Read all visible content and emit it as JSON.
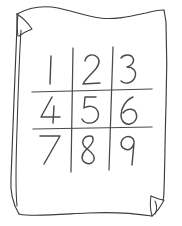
{
  "canvas": {
    "width": 182,
    "height": 226,
    "background_color": "#ffffff"
  },
  "figure": {
    "style": "hand-drawn line sketch",
    "ink_color": "#4a4a4a",
    "outline_color": "#3b3b3b",
    "paper_color": "#ffffff"
  },
  "paper": {
    "name": "sheet-of-paper",
    "description": "Wavy-edged rectangular sheet",
    "corner_folds": [
      {
        "name": "top-left-fold",
        "position": "top-left",
        "label": "dog-ear"
      },
      {
        "name": "bottom-right-fold",
        "position": "bottom-right",
        "label": "dog-ear"
      }
    ]
  },
  "grid": {
    "name": "number-grid",
    "rows": 3,
    "columns": 3,
    "line_count": {
      "vertical": 2,
      "horizontal": 2
    },
    "line_color": "#4a4a4a",
    "cells": [
      [
        {
          "value": "1",
          "row": 0,
          "col": 0
        },
        {
          "value": "2",
          "row": 0,
          "col": 1
        },
        {
          "value": "3",
          "row": 0,
          "col": 2
        }
      ],
      [
        {
          "value": "4",
          "row": 1,
          "col": 0
        },
        {
          "value": "5",
          "row": 1,
          "col": 1
        },
        {
          "value": "6",
          "row": 1,
          "col": 2
        }
      ],
      [
        {
          "value": "7",
          "row": 2,
          "col": 0
        },
        {
          "value": "8",
          "row": 2,
          "col": 1
        },
        {
          "value": "9",
          "row": 2,
          "col": 2
        }
      ]
    ],
    "flat_values": [
      "1",
      "2",
      "3",
      "4",
      "5",
      "6",
      "7",
      "8",
      "9"
    ]
  },
  "accessibility": {
    "alt_text": "A hand-drawn sheet of paper with folded corners containing a three by three grid numbered one through nine."
  }
}
